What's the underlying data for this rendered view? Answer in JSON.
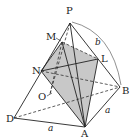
{
  "diagram": {
    "type": "pyramid",
    "labels": {
      "P": "P",
      "M": "M",
      "L": "L",
      "N": "N",
      "B": "B",
      "O": "O",
      "D": "D",
      "A": "A",
      "side_DA": "a",
      "side_AB": "a",
      "edge_PB": "b"
    },
    "colors": {
      "stroke": "#222222",
      "shade": "#c8c8c8"
    }
  }
}
